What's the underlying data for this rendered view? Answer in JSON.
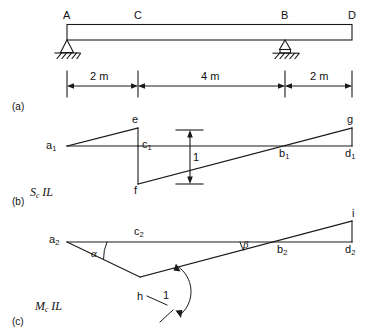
{
  "figure": {
    "type": "influence-line-diagram",
    "panels": [
      {
        "tag": "(a)",
        "caption": ""
      },
      {
        "tag": "(b)",
        "caption": "S",
        "caption_sub": "c",
        "caption_tail": " IL"
      },
      {
        "tag": "(c)",
        "caption": "M",
        "caption_sub": "c",
        "caption_tail": " IL"
      }
    ]
  },
  "beam": {
    "nodes": [
      {
        "name": "A",
        "label": "A",
        "x_m": 0
      },
      {
        "name": "C",
        "label": "C",
        "x_m": 2
      },
      {
        "name": "B",
        "label": "B",
        "x_m": 6
      },
      {
        "name": "D",
        "label": "D",
        "x_m": 8
      }
    ],
    "supports": [
      {
        "at": "A",
        "kind": "pin"
      },
      {
        "at": "B",
        "kind": "pin-on-base"
      }
    ],
    "dimensions": [
      {
        "from": "A",
        "to": "C",
        "label": "2 m",
        "value": 2,
        "unit": "m"
      },
      {
        "from": "C",
        "to": "B",
        "label": "4 m",
        "value": 4,
        "unit": "m"
      },
      {
        "from": "B",
        "to": "D",
        "label": "2 m",
        "value": 2,
        "unit": "m"
      }
    ],
    "total_length_m": 8
  },
  "shear_il": {
    "title_main": "S",
    "title_sub": "c",
    "title_tail": " IL",
    "tag": "(b)",
    "points": [
      {
        "id": "a1",
        "label": "a",
        "sub": "1"
      },
      {
        "id": "e",
        "label": "e",
        "sub": ""
      },
      {
        "id": "c1",
        "label": "c",
        "sub": "1"
      },
      {
        "id": "f",
        "label": "f",
        "sub": ""
      },
      {
        "id": "b1",
        "label": "b",
        "sub": "1"
      },
      {
        "id": "d1",
        "label": "d",
        "sub": "1"
      },
      {
        "id": "g",
        "label": "g",
        "sub": ""
      }
    ],
    "ordinate": {
      "label": "1",
      "value": 1,
      "note": "unit jump at C"
    }
  },
  "moment_il": {
    "title_main": "M",
    "title_sub": "c",
    "title_tail": " IL",
    "tag": "(c)",
    "points": [
      {
        "id": "a2",
        "label": "a",
        "sub": "2"
      },
      {
        "id": "c2",
        "label": "c",
        "sub": "2"
      },
      {
        "id": "b2",
        "label": "b",
        "sub": "2"
      },
      {
        "id": "d2",
        "label": "d",
        "sub": "2"
      },
      {
        "id": "h",
        "label": "h",
        "sub": ""
      },
      {
        "id": "i",
        "label": "i",
        "sub": ""
      }
    ],
    "angles": [
      {
        "id": "alpha",
        "label": "α",
        "at": "a2"
      },
      {
        "id": "beta",
        "label": "β",
        "at": "b2"
      }
    ],
    "rotation": {
      "label": "1",
      "value": 1,
      "note": "unit relative rotation at h"
    }
  },
  "colors": {
    "line": "#1a1a1a",
    "background": "#ffffff",
    "text": "#111111"
  }
}
